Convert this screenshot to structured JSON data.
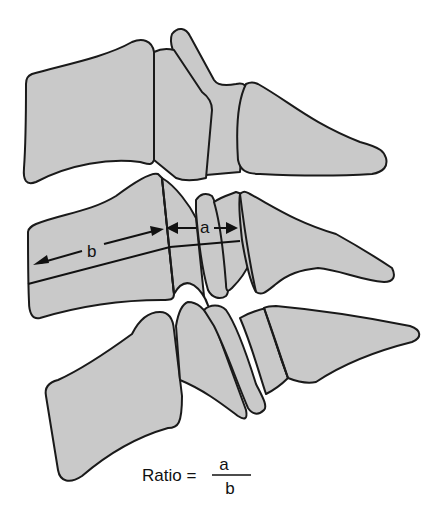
{
  "diagram": {
    "fill_color": "#c9c9c9",
    "stroke_color": "#1a1a1a",
    "labels": {
      "a": "a",
      "b": "b"
    },
    "measurements": [
      {
        "name": "a",
        "description": "double-headed arrow spanning the narrow middle segments"
      },
      {
        "name": "b",
        "description": "double-headed arrow spanning the large left body"
      }
    ],
    "formula": {
      "lhs": "Ratio =",
      "numerator": "a",
      "denominator": "b"
    }
  }
}
